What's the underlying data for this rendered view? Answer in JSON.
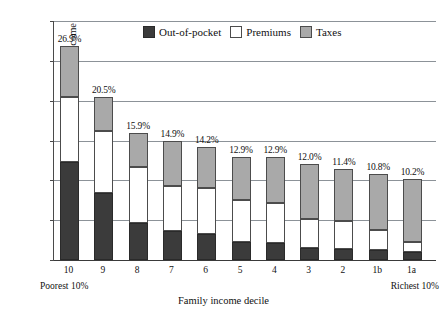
{
  "chart_data": {
    "type": "bar",
    "stacked": true,
    "title": "",
    "subtitle": "",
    "xlabel": "Family income decile",
    "ylabel": "Per cent of family income",
    "ylim": [
      0,
      30
    ],
    "yticks": [
      "0%",
      "5%",
      "10%",
      "15%",
      "20%",
      "25%",
      "30%"
    ],
    "ytick_values": [
      0,
      5,
      10,
      15,
      20,
      25,
      30
    ],
    "grid": true,
    "legend_position": "top-center",
    "categories": [
      "10",
      "9",
      "8",
      "7",
      "6",
      "5",
      "4",
      "3",
      "2",
      "1b",
      "1a"
    ],
    "x_end_labels": {
      "left": "Poorest 10%",
      "right": "Richest 10%"
    },
    "series": [
      {
        "name": "Out-of-pocket",
        "color": "#3b3b3b",
        "values": [
          12.3,
          8.4,
          4.6,
          3.6,
          3.3,
          2.3,
          2.1,
          1.5,
          1.4,
          1.3,
          1.0
        ]
      },
      {
        "name": "Premiums",
        "color": "#ffffff",
        "values": [
          8.2,
          7.8,
          7.1,
          5.7,
          5.7,
          5.2,
          5.0,
          3.6,
          3.5,
          2.5,
          1.3
        ]
      },
      {
        "name": "Taxes",
        "color": "#a9a9a9",
        "values": [
          6.4,
          4.3,
          4.2,
          5.6,
          5.2,
          5.4,
          5.8,
          6.9,
          6.5,
          7.0,
          7.9
        ]
      }
    ],
    "totals": [
      26.9,
      20.5,
      15.9,
      14.9,
      14.2,
      12.9,
      12.9,
      12.0,
      11.4,
      10.8,
      10.2
    ],
    "total_labels": [
      "26.9%",
      "20.5%",
      "15.9%",
      "14.9%",
      "14.2%",
      "12.9%",
      "12.9%",
      "12.0%",
      "11.4%",
      "10.8%",
      "10.2%"
    ]
  },
  "legend": {
    "items": [
      {
        "label": "Out-of-pocket",
        "swatch": "oop"
      },
      {
        "label": "Premiums",
        "swatch": "prem"
      },
      {
        "label": "Taxes",
        "swatch": "tax"
      }
    ]
  }
}
